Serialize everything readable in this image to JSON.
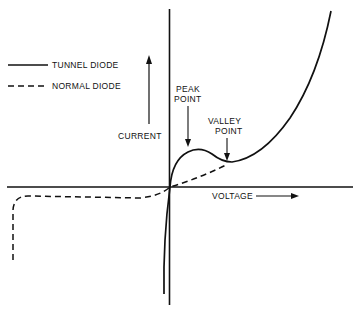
{
  "diagram": {
    "type": "I-V characteristic",
    "legend": [
      {
        "label": "TUNNEL DIODE",
        "style": "solid"
      },
      {
        "label": "NORMAL DIODE",
        "style": "dashed"
      }
    ],
    "axes": {
      "y_label": "CURRENT",
      "x_label": "VOLTAGE"
    },
    "annotations": [
      {
        "label_line1": "PEAK",
        "label_line2": "POINT"
      },
      {
        "label_line1": "VALLEY",
        "label_line2": "POINT"
      }
    ],
    "colors": {
      "ink": "#111111",
      "background": "#ffffff"
    }
  }
}
